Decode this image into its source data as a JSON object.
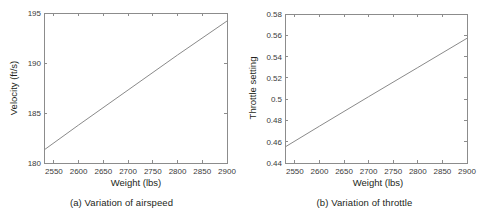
{
  "figure": {
    "panels": [
      {
        "id": "a",
        "caption": "(a) Variation of airspeed",
        "chart_index": 0
      },
      {
        "id": "b",
        "caption": "(b) Variation of throttle",
        "chart_index": 1
      }
    ]
  },
  "chart_data": [
    {
      "type": "line",
      "title": "",
      "xlabel": "Weight (lbs)",
      "ylabel": "Velocity (ft/s)",
      "xlim": [
        2530,
        2900
      ],
      "ylim": [
        180,
        195
      ],
      "grid": false,
      "legend": null,
      "xticks": [
        2550,
        2600,
        2650,
        2700,
        2750,
        2800,
        2850,
        2900
      ],
      "xticklabels": [
        "2550",
        "2600",
        "2650",
        "2700",
        "2750",
        "2800",
        "2850",
        "2900"
      ],
      "yticks": [
        180,
        185,
        190,
        195
      ],
      "yticklabels": [
        "180",
        "185",
        "190",
        "195"
      ],
      "series": [
        {
          "name": "airspeed",
          "color": "#8a8a8a",
          "x": [
            2530,
            2600,
            2700,
            2800,
            2900
          ],
          "y": [
            181.3,
            183.8,
            187.3,
            190.8,
            194.2
          ]
        }
      ]
    },
    {
      "type": "line",
      "title": "",
      "xlabel": "Weight (lbs)",
      "ylabel": "Throttle setting",
      "xlim": [
        2530,
        2900
      ],
      "ylim": [
        0.44,
        0.58
      ],
      "grid": false,
      "legend": null,
      "xticks": [
        2550,
        2600,
        2650,
        2700,
        2750,
        2800,
        2850,
        2900
      ],
      "xticklabels": [
        "2550",
        "2600",
        "2650",
        "2700",
        "2750",
        "2800",
        "2850",
        "2900"
      ],
      "yticks": [
        0.44,
        0.46,
        0.48,
        0.5,
        0.52,
        0.54,
        0.56,
        0.58
      ],
      "yticklabels": [
        "0.44",
        "0.46",
        "0.48",
        "0.5",
        "0.52",
        "0.54",
        "0.56",
        "0.58"
      ],
      "series": [
        {
          "name": "throttle",
          "color": "#8a8a8a",
          "x": [
            2530,
            2600,
            2700,
            2800,
            2900
          ],
          "y": [
            0.455,
            0.4746,
            0.5023,
            0.5297,
            0.5572
          ]
        }
      ]
    }
  ]
}
